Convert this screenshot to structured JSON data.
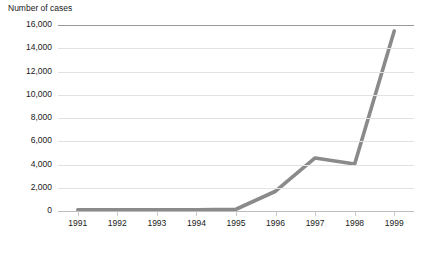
{
  "chart_data": {
    "type": "line",
    "title": "Number of cases",
    "xlabel": "",
    "ylabel": "Number of cases",
    "categories": [
      "1991",
      "1992",
      "1993",
      "1994",
      "1995",
      "1996",
      "1997",
      "1998",
      "1999"
    ],
    "values": [
      100,
      100,
      100,
      100,
      150,
      1700,
      4560,
      4050,
      15480
    ],
    "series": [
      {
        "name": "Number of cases",
        "values": [
          100,
          100,
          100,
          100,
          150,
          1700,
          4560,
          4050,
          15480
        ]
      }
    ],
    "ylim": [
      0,
      16000
    ],
    "ytick_labels": [
      "16,000",
      "14,000",
      "12,000",
      "10,000",
      "8,000",
      "6,000",
      "4,000",
      "2,000",
      "0"
    ],
    "ytick_values": [
      16000,
      14000,
      12000,
      10000,
      8000,
      6000,
      4000,
      2000,
      0
    ],
    "grid": true,
    "legend": "none",
    "line_color": "#8a8a8a",
    "grid_color": "#e2e2e2",
    "axis_color": "#bdbdbd",
    "top_border_color": "#9a9a9a",
    "background": "#ffffff"
  }
}
